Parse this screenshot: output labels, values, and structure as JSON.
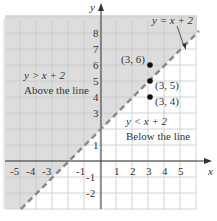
{
  "chart_data": {
    "type": "scatter",
    "title": "",
    "xlabel": "x",
    "ylabel": "y",
    "xlim": [
      -6,
      6
    ],
    "ylim": [
      -3,
      9
    ],
    "grid": true,
    "x_ticks": [
      "-5",
      "-4",
      "-3",
      "-1",
      "1",
      "2",
      "3",
      "4",
      "5"
    ],
    "y_ticks": [
      "-2",
      "-1",
      "1",
      "3",
      "4",
      "5",
      "6",
      "7",
      "8"
    ],
    "boundary_line": {
      "equation": "y = x + 2",
      "style": "dashed",
      "slope": 1,
      "intercept": 2
    },
    "regions": [
      {
        "inequality": "y > x + 2",
        "description": "Above the line",
        "shaded": true
      },
      {
        "inequality": "y < x + 2",
        "description": "Below the line",
        "shaded": false
      }
    ],
    "points": [
      {
        "label": "(3, 6)",
        "x": 3,
        "y": 6
      },
      {
        "label": "(3, 5)",
        "x": 3,
        "y": 5
      },
      {
        "label": "(3, 4)",
        "x": 3,
        "y": 4
      }
    ],
    "colors": {
      "shade": "#dcdcdc",
      "grid": "#c8c8c8",
      "line": "#8a8a8a",
      "axis": "#333333",
      "point": "#111111"
    }
  },
  "labels": {
    "y_axis": "y",
    "x_axis": "x",
    "line_eq": "y = x + 2",
    "above_ineq": "y > x + 2",
    "above_desc": "Above the line",
    "below_ineq": "y < x + 2",
    "below_desc": "Below the line",
    "p1": "(3, 6)",
    "p2": "(3, 5)",
    "p3": "(3, 4)"
  }
}
